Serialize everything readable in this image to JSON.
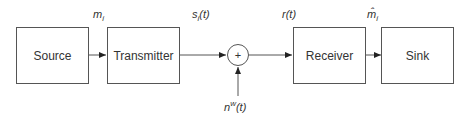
{
  "blocks": {
    "source": "Source",
    "transmitter": "Transmitter",
    "adder": "+",
    "receiver": "Receiver",
    "sink": "Sink"
  },
  "signals": {
    "message": "m",
    "message_sub": "i",
    "transmitted": "s",
    "transmitted_sub": "i",
    "transmitted_arg": "(t)",
    "received": "r(t)",
    "estimate": "m̂",
    "estimate_sub": "i",
    "noise": "n",
    "noise_sup": "w",
    "noise_arg": "(t)"
  }
}
